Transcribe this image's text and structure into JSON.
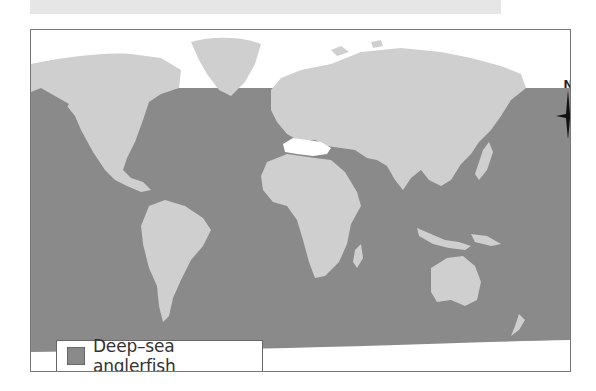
{
  "map": {
    "title": "",
    "colors": {
      "ocean_range": "#8a8a8a",
      "land": "#cfcfcf",
      "ice_background": "#ffffff",
      "border": "#777777",
      "top_banner": "#e6e6e6"
    },
    "compass": {
      "label": "N",
      "icon": "north-arrow-icon"
    },
    "legend": {
      "items": [
        {
          "label": "Deep–sea anglerfish",
          "color": "#8a8a8a"
        }
      ]
    }
  }
}
